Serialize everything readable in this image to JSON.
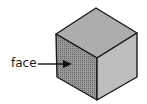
{
  "diagram": {
    "type": "cube",
    "label": "face",
    "colors": {
      "top_face": "#a9a9a9",
      "left_face": "#8a8a8a",
      "right_face": "#b8b8b8",
      "edge": "#1a1a1a"
    }
  }
}
